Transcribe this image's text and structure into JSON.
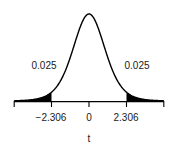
{
  "chart_data": {
    "type": "line",
    "title": "",
    "xlabel": "t",
    "ylabel": "",
    "distribution": "Student t (df = 8)",
    "df": 8,
    "xlim": [
      -4.6,
      4.6
    ],
    "x_ticks": [
      -4.6,
      -2.306,
      0,
      2.306,
      4.6
    ],
    "tick_labels": [
      "",
      "−2.306",
      "0",
      "2.306",
      ""
    ],
    "critical_values": [
      -2.306,
      2.306
    ],
    "shaded_regions": [
      {
        "from": -4.6,
        "to": -2.306,
        "area_label": "0.025"
      },
      {
        "from": 2.306,
        "to": 4.6,
        "area_label": "0.025"
      }
    ],
    "annotations": [
      {
        "text": "0.025",
        "side": "left"
      },
      {
        "text": "0.025",
        "side": "right"
      }
    ],
    "grid": false,
    "legend": null,
    "colors": {
      "curve": "#000000",
      "shade": "#000000",
      "axis": "#000000",
      "text": "#1a1a1a"
    }
  }
}
